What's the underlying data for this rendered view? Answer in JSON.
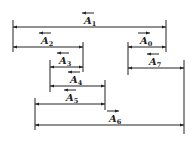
{
  "diagram": {
    "title": "",
    "color": "#222222",
    "dimensions": [
      {
        "id": "A1",
        "base": "A",
        "sub": "1",
        "vector_dir": "left",
        "y": 27,
        "x1": 13,
        "x2": 166,
        "label_x": 88
      },
      {
        "id": "A2",
        "base": "A",
        "sub": "2",
        "vector_dir": "left",
        "y": 47,
        "x1": 13,
        "x2": 83,
        "label_x": 45
      },
      {
        "id": "A0",
        "base": "A",
        "sub": "0",
        "vector_dir": "right",
        "y": 47,
        "x1": 128,
        "x2": 166,
        "label_x": 144
      },
      {
        "id": "A3",
        "base": "A",
        "sub": "3",
        "vector_dir": "left",
        "y": 67,
        "x1": 50,
        "x2": 83,
        "label_x": 63
      },
      {
        "id": "A7",
        "base": "A",
        "sub": "7",
        "vector_dir": "left",
        "y": 68,
        "x1": 128,
        "x2": 184,
        "label_x": 153
      },
      {
        "id": "A4",
        "base": "A",
        "sub": "4",
        "vector_dir": "left",
        "y": 86,
        "x1": 50,
        "x2": 105,
        "label_x": 74
      },
      {
        "id": "A5",
        "base": "A",
        "sub": "5",
        "vector_dir": "left",
        "y": 104,
        "x1": 35,
        "x2": 105,
        "label_x": 70
      },
      {
        "id": "A6",
        "base": "A",
        "sub": "6",
        "vector_dir": "right",
        "y": 125,
        "x1": 35,
        "x2": 184,
        "label_x": 113
      }
    ],
    "extension_lines": [
      {
        "x": 13,
        "y1": 20,
        "y2": 52
      },
      {
        "x": 166,
        "y1": 20,
        "y2": 52
      },
      {
        "x": 83,
        "y1": 42,
        "y2": 72
      },
      {
        "x": 128,
        "y1": 42,
        "y2": 75
      },
      {
        "x": 50,
        "y1": 60,
        "y2": 92
      },
      {
        "x": 184,
        "y1": 60,
        "y2": 134
      },
      {
        "x": 105,
        "y1": 80,
        "y2": 110
      },
      {
        "x": 35,
        "y1": 98,
        "y2": 130
      }
    ]
  }
}
